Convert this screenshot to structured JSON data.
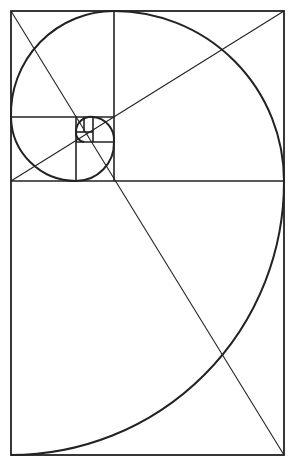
{
  "diagram": {
    "title": "",
    "type": "golden-spiral",
    "colors": {
      "background": "#ffffff",
      "stroke": "#222222"
    },
    "outer_rect": {
      "x": 11,
      "y": 11,
      "w": 273,
      "h": 444
    },
    "lines": [
      {
        "x1": 11,
        "y1": 181,
        "x2": 284,
        "y2": 181
      },
      {
        "x1": 114,
        "y1": 11,
        "x2": 114,
        "y2": 181
      },
      {
        "x1": 11,
        "y1": 117,
        "x2": 114,
        "y2": 117
      },
      {
        "x1": 76,
        "y1": 117,
        "x2": 76,
        "y2": 181
      },
      {
        "x1": 76,
        "y1": 142,
        "x2": 114,
        "y2": 142
      },
      {
        "x1": 93,
        "y1": 117,
        "x2": 93,
        "y2": 142
      },
      {
        "x1": 76,
        "y1": 132,
        "x2": 93,
        "y2": 132
      },
      {
        "x1": 84,
        "y1": 117,
        "x2": 84,
        "y2": 132
      }
    ],
    "diagonals": [
      {
        "x1": 11,
        "y1": 11,
        "x2": 284,
        "y2": 455
      },
      {
        "x1": 11,
        "y1": 181,
        "x2": 284,
        "y2": 11
      }
    ],
    "spiral_arcs": [
      {
        "from": [
          11,
          455
        ],
        "to": [
          284,
          181
        ],
        "r": 273,
        "sweep": 0
      },
      {
        "from": [
          284,
          181
        ],
        "to": [
          114,
          11
        ],
        "r": 170,
        "sweep": 0
      },
      {
        "from": [
          114,
          11
        ],
        "to": [
          11,
          117
        ],
        "r": 103,
        "sweep": 0
      },
      {
        "from": [
          11,
          117
        ],
        "to": [
          76,
          181
        ],
        "r": 65,
        "sweep": 0
      },
      {
        "from": [
          76,
          181
        ],
        "to": [
          114,
          142
        ],
        "r": 38,
        "sweep": 0
      },
      {
        "from": [
          114,
          142
        ],
        "to": [
          93,
          117
        ],
        "r": 23,
        "sweep": 0
      },
      {
        "from": [
          93,
          117
        ],
        "to": [
          76,
          132
        ],
        "r": 15,
        "sweep": 0
      },
      {
        "from": [
          76,
          132
        ],
        "to": [
          84,
          142
        ],
        "r": 9,
        "sweep": 0
      }
    ]
  }
}
